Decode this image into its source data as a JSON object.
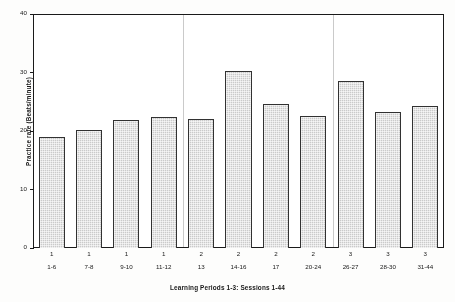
{
  "chart_data": {
    "type": "bar",
    "title": "",
    "xlabel": "Learning Periods 1-3: Sessions 1-44",
    "ylabel": "Practice rate (Beats/minute)",
    "ylim": [
      0,
      40
    ],
    "yticks": [
      0,
      10,
      20,
      30,
      40
    ],
    "grid": false,
    "legend": "none",
    "categories": [
      "1-6",
      "7-8",
      "9-10",
      "11-12",
      "13",
      "14-16",
      "17",
      "20-24",
      "26-27",
      "28-30",
      "31-44"
    ],
    "group_labels": [
      "1",
      "1",
      "1",
      "1",
      "2",
      "2",
      "2",
      "2",
      "3",
      "3",
      "3"
    ],
    "values": [
      19,
      20.1,
      21.9,
      22.4,
      22,
      30.2,
      24.6,
      22.6,
      28.6,
      23.3,
      24.3
    ],
    "groups": [
      {
        "period": "1",
        "sessions": [
          "1-6",
          "7-8",
          "9-10",
          "11-12"
        ]
      },
      {
        "period": "2",
        "sessions": [
          "13",
          "14-16",
          "17",
          "20-24"
        ]
      },
      {
        "period": "3",
        "sessions": [
          "26-27",
          "28-30",
          "31-44"
        ]
      }
    ],
    "bar_color": "#c9c9c9",
    "bar_edge_color": "#343434",
    "separator_color": "#c9c9c9",
    "axis_color": "#1c1c1c"
  }
}
